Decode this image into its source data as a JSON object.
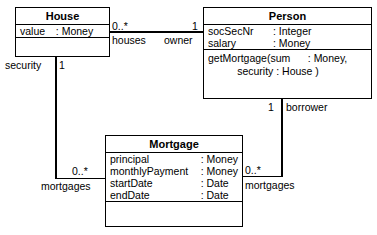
{
  "diagram": {
    "classes": {
      "house": {
        "name": "House",
        "attributes": [
          {
            "name": "value",
            "type": ": Money"
          }
        ],
        "operations": []
      },
      "person": {
        "name": "Person",
        "attributes": [
          {
            "name": "socSecNr",
            "type": ": Integer"
          },
          {
            "name": "salary",
            "type": ": Money"
          }
        ],
        "operations": [
          "getMortgage(sum      : Money,",
          "          security : House )"
        ]
      },
      "mortgage": {
        "name": "Mortgage",
        "attributes": [
          {
            "name": "principal",
            "type": ": Money"
          },
          {
            "name": "monthlyPayment",
            "type": ": Money"
          },
          {
            "name": "startDate",
            "type": ": Date"
          },
          {
            "name": "endDate",
            "type": ": Date"
          }
        ],
        "operations": []
      }
    },
    "associations": {
      "house_person": {
        "source_multiplicity": "0..*",
        "source_role": "houses",
        "target_multiplicity": "1",
        "target_role": "owner"
      },
      "house_mortgage": {
        "source_multiplicity": "1",
        "source_role": "security",
        "target_multiplicity": "0..*",
        "target_role": "mortgages"
      },
      "person_mortgage": {
        "source_multiplicity": "1",
        "source_role": "borrower",
        "target_multiplicity": "0..*",
        "target_role": "mortgages"
      }
    },
    "colors": {
      "line": "#000000",
      "background": "#ffffff",
      "text": "#000000"
    }
  }
}
